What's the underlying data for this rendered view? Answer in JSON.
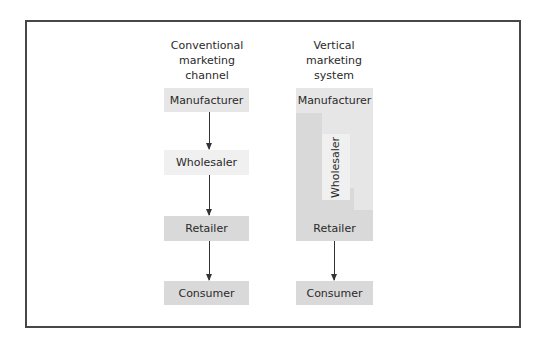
{
  "diagram": {
    "colors": {
      "frame_border": "#474747",
      "manufacturer": "#e6e6e6",
      "wholesaler": "#f0f0f0",
      "retailer": "#d9d9d9",
      "consumer": "#d9d9d9",
      "arrow": "#333333"
    },
    "conventional": {
      "heading": [
        "Conventional",
        "marketing",
        "channel"
      ],
      "levels": [
        "Manufacturer",
        "Wholesaler",
        "Retailer",
        "Consumer"
      ]
    },
    "vertical": {
      "heading": [
        "Vertical",
        "marketing",
        "system"
      ],
      "integrated_levels": [
        "Manufacturer",
        "Wholesaler",
        "Retailer"
      ],
      "consumer": "Consumer"
    }
  }
}
